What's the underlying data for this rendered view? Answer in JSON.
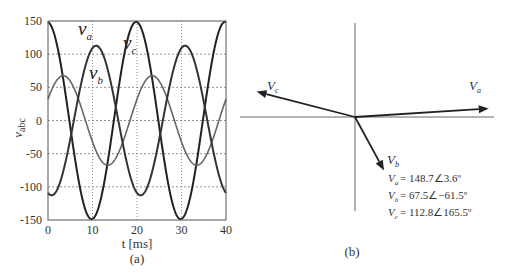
{
  "chart_data": [
    {
      "type": "line",
      "panel_label": "(a)",
      "title": "",
      "xlabel": "t [ms]",
      "ylabel": "v_abc",
      "xlim": [
        0,
        40
      ],
      "ylim": [
        -150,
        150
      ],
      "xticks": [
        "0",
        "10",
        "20",
        "30",
        "40"
      ],
      "yticks": [
        "150",
        "100",
        "50",
        "0",
        "-50",
        "-100",
        "-150"
      ],
      "grid": true,
      "frequency_hz": 50,
      "series": [
        {
          "name": "v_a",
          "label_main": "v",
          "label_sub": "a",
          "amplitude": 148.7,
          "phase_deg": 3.6,
          "color": "#222222",
          "width": 2
        },
        {
          "name": "v_b",
          "label_main": "v",
          "label_sub": "b",
          "amplitude": 67.5,
          "phase_deg": -61.5,
          "color": "#666666",
          "width": 1.6
        },
        {
          "name": "v_c",
          "label_main": "v",
          "label_sub": "c",
          "amplitude": 112.8,
          "phase_deg": 165.5,
          "color": "#333333",
          "width": 2
        }
      ]
    },
    {
      "type": "phasor",
      "panel_label": "(b)",
      "phasors": [
        {
          "name": "V_a",
          "label_main": "V",
          "label_sub": "a",
          "magnitude": 148.7,
          "angle_deg": 3.6,
          "equation": "= 148.7∠3.6º"
        },
        {
          "name": "V_b",
          "label_main": "V",
          "label_sub": "b",
          "magnitude": 67.5,
          "angle_deg": -61.5,
          "equation": "= 67.5∠−61.5º"
        },
        {
          "name": "V_c",
          "label_main": "V",
          "label_sub": "c",
          "magnitude": 112.8,
          "angle_deg": 165.5,
          "equation": "= 112.8∠165.5º"
        }
      ]
    }
  ]
}
